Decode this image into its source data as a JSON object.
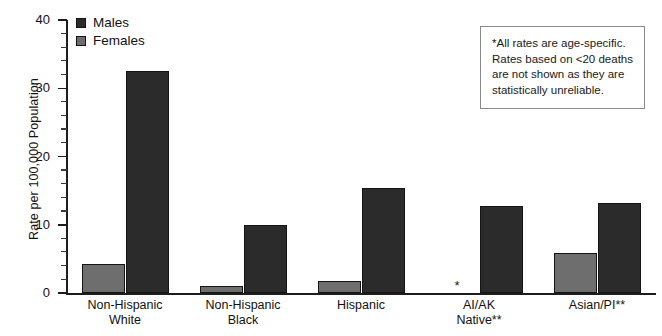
{
  "chart_data": {
    "type": "bar",
    "title": "",
    "xlabel": "",
    "ylabel": "Rate per 100,000 Population",
    "ylim": [
      0,
      40
    ],
    "yticks": [
      0,
      10,
      20,
      30,
      40
    ],
    "ytick_labels": [
      "0",
      "10",
      "20",
      "30",
      "40"
    ],
    "grid": false,
    "legend_position": "top-left",
    "categories": [
      "Non-Hispanic White",
      "Non-Hispanic Black",
      "Hispanic",
      "AI/AK Native**",
      "Asian/PI**"
    ],
    "category_lines": [
      [
        "Non-Hispanic",
        "White"
      ],
      [
        "Non-Hispanic",
        "Black"
      ],
      [
        "Hispanic",
        ""
      ],
      [
        "AI/AK",
        "Native**"
      ],
      [
        "Asian/PI**",
        ""
      ]
    ],
    "series": [
      {
        "name": "Females",
        "color": "#6e6e6e",
        "values": [
          4.2,
          1.0,
          1.7,
          null,
          5.8
        ],
        "suppressed": [
          false,
          false,
          false,
          true,
          false
        ],
        "suppressed_marker": "*"
      },
      {
        "name": "Males",
        "color": "#2b2b2b",
        "values": [
          32.5,
          10.0,
          15.4,
          12.8,
          13.2
        ],
        "suppressed": [
          false,
          false,
          false,
          false,
          false
        ],
        "suppressed_marker": "*"
      }
    ]
  },
  "legend": {
    "items": [
      {
        "label": "Males",
        "color": "#2b2b2b"
      },
      {
        "label": "Females",
        "color": "#6e6e6e"
      }
    ]
  },
  "note": {
    "lines": [
      "*All rates are age-specific.",
      "Rates based on <20 deaths",
      "are not shown as they are",
      "statistically unreliable."
    ]
  }
}
